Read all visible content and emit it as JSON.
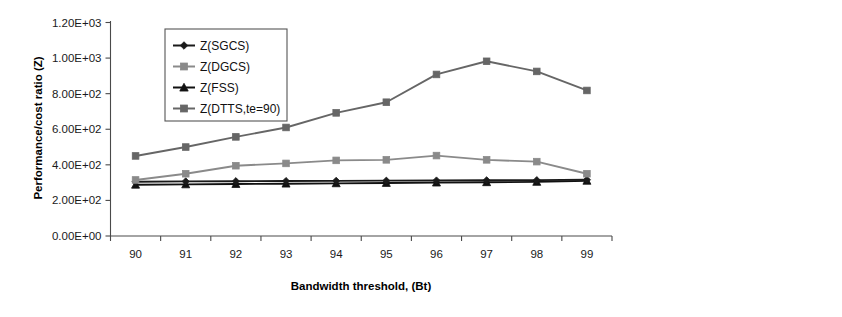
{
  "chart_data": {
    "type": "line",
    "title": "",
    "xlabel": "Bandwidth threshold, (Bt)",
    "ylabel": "Performance/cost ratio (Z)",
    "categories": [
      "90",
      "91",
      "92",
      "93",
      "94",
      "95",
      "96",
      "97",
      "98",
      "99"
    ],
    "x": [
      90,
      91,
      92,
      93,
      94,
      95,
      96,
      97,
      98,
      99
    ],
    "ylim": [
      0,
      1200
    ],
    "ytick_labels": [
      "0.00E+00",
      "2.00E+02",
      "4.00E+02",
      "6.00E+02",
      "8.00E+02",
      "1.00E+03",
      "1.20E+03"
    ],
    "ytick_values": [
      0,
      200,
      400,
      600,
      800,
      1000,
      1200
    ],
    "grid": false,
    "legend_position": "top-left-inside",
    "series": [
      {
        "name": "Z(SGCS)",
        "marker": "diamond",
        "color": "#1a1a1a",
        "values": [
          305,
          307,
          308,
          309,
          310,
          311,
          312,
          313,
          314,
          316
        ]
      },
      {
        "name": "Z(DGCS)",
        "marker": "square",
        "color": "#8a8a8a",
        "values": [
          315,
          350,
          395,
          408,
          425,
          428,
          452,
          428,
          418,
          350
        ]
      },
      {
        "name": "Z(FSS)",
        "marker": "triangle",
        "color": "#111111",
        "values": [
          288,
          290,
          292,
          294,
          296,
          298,
          300,
          302,
          304,
          310
        ]
      },
      {
        "name": "Z(DTTS,te=90)",
        "marker": "square",
        "color": "#666666",
        "values": [
          450,
          500,
          557,
          610,
          692,
          752,
          908,
          982,
          925,
          818
        ]
      }
    ]
  },
  "axes": {
    "y_axis_title": "Performance/cost ratio (Z)",
    "x_axis_title": "Bandwidth threshold, (Bt)"
  }
}
